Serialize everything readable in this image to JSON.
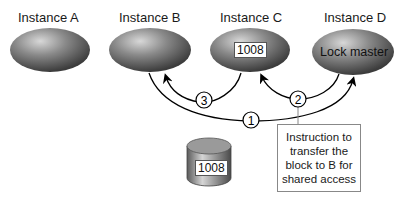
{
  "instances": [
    {
      "id": "A",
      "label": "Instance A"
    },
    {
      "id": "B",
      "label": "Instance B"
    },
    {
      "id": "C",
      "label": "Instance C",
      "block": "1008"
    },
    {
      "id": "D",
      "label": "Instance D",
      "role": "Lock master"
    }
  ],
  "disk": {
    "block": "1008"
  },
  "steps": [
    {
      "number": "1",
      "from": "B",
      "to": "D"
    },
    {
      "number": "2",
      "from": "D",
      "to": "C"
    },
    {
      "number": "3",
      "from": "C",
      "to": "B"
    }
  ],
  "callout": {
    "lines": [
      "Instruction to",
      "transfer the",
      "block to B for",
      "shared access"
    ]
  }
}
